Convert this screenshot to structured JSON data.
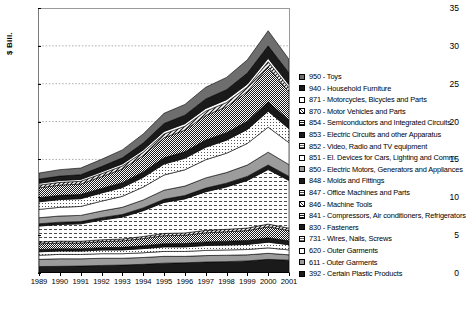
{
  "axis": {
    "ylabel": "$ Bill.",
    "yticks": [
      "0",
      "5",
      "10",
      "15",
      "20",
      "25",
      "30",
      "35"
    ],
    "ylim": [
      0,
      35
    ],
    "xticks": [
      "1989",
      "1990",
      "1991",
      "1992",
      "1993",
      "1994",
      "1995",
      "1996",
      "1997",
      "1998",
      "1999",
      "2000",
      "2001"
    ]
  },
  "legend": {
    "items": [
      {
        "label": "950 - Toys",
        "code": "950",
        "pattern": "dark-gray-solid"
      },
      {
        "label": "940 - Household Furniture",
        "code": "940",
        "pattern": "black-solid"
      },
      {
        "label": "871 - Motorcycles, Bicycles and Parts",
        "code": "871",
        "pattern": "white-solid"
      },
      {
        "label": "870 - Motor Vehicles and Parts",
        "code": "870",
        "pattern": "diagonal-hatch"
      },
      {
        "label": "854 - Semiconductors and Integrated Circuits",
        "code": "854",
        "pattern": "checker-dense"
      },
      {
        "label": "853 - Electric Circuits and other Apparatus",
        "code": "853",
        "pattern": "black-solid"
      },
      {
        "label": "852 - Video, Radio and TV equipment",
        "code": "852",
        "pattern": "light-dots"
      },
      {
        "label": "851 - El. Devices for Cars, Lighting and Comm.",
        "code": "851",
        "pattern": "white-solid"
      },
      {
        "label": "850 - Electric Motors, Generators and Appliances",
        "code": "850",
        "pattern": "mid-gray-solid"
      },
      {
        "label": "848 - Molds and Fittings",
        "code": "848",
        "pattern": "black-solid"
      },
      {
        "label": "847 - Office Machines and Parts",
        "code": "847",
        "pattern": "dash-grid"
      },
      {
        "label": "846 - Machine Tools",
        "code": "846",
        "pattern": "diagonal-hatch"
      },
      {
        "label": "841 - Compressors, Air conditioners, Refrigerators",
        "code": "841",
        "pattern": "checker-dense"
      },
      {
        "label": "830 - Fasteners",
        "code": "830",
        "pattern": "black-solid"
      },
      {
        "label": "731 - Wires, Nails, Screws",
        "code": "731",
        "pattern": "light-dots"
      },
      {
        "label": "620 - Outer Garments",
        "code": "620",
        "pattern": "white-solid"
      },
      {
        "label": "611 - Outer Garments",
        "code": "611",
        "pattern": "mid-gray-solid"
      },
      {
        "label": "392 - Certain Plastic Products",
        "code": "392",
        "pattern": "black-solid"
      }
    ]
  },
  "chart_data": {
    "type": "area",
    "title": "",
    "xlabel": "",
    "ylabel": "$ Bill.",
    "ylim": [
      0,
      35
    ],
    "grid": true,
    "legend_position": "right",
    "x": [
      "1989",
      "1990",
      "1991",
      "1992",
      "1993",
      "1994",
      "1995",
      "1996",
      "1997",
      "1998",
      "1999",
      "2000",
      "2001"
    ],
    "series": [
      {
        "name": "392 - Certain Plastic Products",
        "pattern": "black-solid",
        "values": [
          0.85,
          0.88,
          0.92,
          1.0,
          1.05,
          1.15,
          1.3,
          1.35,
          1.45,
          1.5,
          1.6,
          1.8,
          1.7
        ]
      },
      {
        "name": "611 - Outer Garments",
        "pattern": "mid-gray-solid",
        "values": [
          0.95,
          1.0,
          0.95,
          0.95,
          0.9,
          0.9,
          0.9,
          0.85,
          0.85,
          0.85,
          0.8,
          0.8,
          0.7
        ]
      },
      {
        "name": "620 - Outer Garments",
        "pattern": "white-solid",
        "values": [
          0.55,
          0.58,
          0.58,
          0.6,
          0.6,
          0.62,
          0.65,
          0.65,
          0.68,
          0.7,
          0.7,
          0.72,
          0.65
        ]
      },
      {
        "name": "731 - Wires, Nails, Screws",
        "pattern": "light-dots",
        "values": [
          0.45,
          0.45,
          0.45,
          0.48,
          0.5,
          0.55,
          0.6,
          0.6,
          0.65,
          0.65,
          0.68,
          0.75,
          0.68
        ]
      },
      {
        "name": "830 - Fasteners",
        "pattern": "black-solid",
        "values": [
          0.3,
          0.3,
          0.3,
          0.32,
          0.34,
          0.38,
          0.42,
          0.44,
          0.48,
          0.5,
          0.52,
          0.58,
          0.52
        ]
      },
      {
        "name": "841 - Compressors, Air conditioners, Refrigerators",
        "pattern": "checker-dense",
        "values": [
          0.75,
          0.75,
          0.75,
          0.8,
          0.85,
          0.95,
          1.05,
          1.1,
          1.2,
          1.25,
          1.3,
          1.45,
          1.35
        ]
      },
      {
        "name": "846 - Machine Tools",
        "pattern": "diagonal-hatch",
        "values": [
          0.25,
          0.25,
          0.24,
          0.24,
          0.25,
          0.27,
          0.3,
          0.3,
          0.32,
          0.32,
          0.33,
          0.36,
          0.32
        ]
      },
      {
        "name": "847 - Office Machines and Parts",
        "pattern": "dash-grid",
        "values": [
          2.1,
          2.2,
          2.3,
          2.6,
          2.9,
          3.4,
          4.1,
          4.5,
          5.1,
          5.6,
          6.3,
          7.2,
          6.3
        ]
      },
      {
        "name": "848 - Molds and Fittings",
        "pattern": "black-solid",
        "values": [
          0.3,
          0.3,
          0.3,
          0.32,
          0.34,
          0.38,
          0.42,
          0.44,
          0.48,
          0.5,
          0.53,
          0.6,
          0.54
        ]
      },
      {
        "name": "850 - Electric Motors, Generators and Appliances",
        "pattern": "mid-gray-solid",
        "values": [
          0.8,
          0.82,
          0.82,
          0.88,
          0.95,
          1.05,
          1.2,
          1.25,
          1.35,
          1.4,
          1.5,
          1.7,
          1.55
        ]
      },
      {
        "name": "851 - El. Devices for Cars, Lighting and Comm.",
        "pattern": "white-solid",
        "values": [
          1.1,
          1.15,
          1.18,
          1.3,
          1.45,
          1.7,
          2.0,
          2.15,
          2.4,
          2.55,
          2.85,
          3.3,
          2.9
        ]
      },
      {
        "name": "852 - Video, Radio and TV equipment",
        "pattern": "light-dots",
        "values": [
          1.0,
          1.02,
          1.02,
          1.08,
          1.15,
          1.28,
          1.45,
          1.52,
          1.65,
          1.72,
          1.85,
          2.1,
          1.85
        ]
      },
      {
        "name": "853 - Electric Circuits and other Apparatus",
        "pattern": "black-solid",
        "values": [
          0.55,
          0.56,
          0.56,
          0.6,
          0.65,
          0.72,
          0.82,
          0.86,
          0.95,
          1.0,
          1.08,
          1.25,
          1.1
        ]
      },
      {
        "name": "854 - Semiconductors and Integrated Circuits",
        "pattern": "checker-dense",
        "values": [
          1.3,
          1.35,
          1.38,
          1.55,
          1.8,
          2.15,
          2.65,
          2.85,
          3.25,
          3.4,
          3.9,
          4.6,
          3.7
        ]
      },
      {
        "name": "870 - Motor Vehicles and Parts",
        "pattern": "diagonal-hatch",
        "values": [
          0.35,
          0.36,
          0.36,
          0.38,
          0.4,
          0.44,
          0.5,
          0.52,
          0.56,
          0.58,
          0.62,
          0.7,
          0.62
        ]
      },
      {
        "name": "871 - Motorcycles, Bicycles and Parts",
        "pattern": "white-solid",
        "values": [
          0.25,
          0.25,
          0.25,
          0.26,
          0.28,
          0.3,
          0.33,
          0.34,
          0.36,
          0.37,
          0.39,
          0.44,
          0.39
        ]
      },
      {
        "name": "940 - Household Furniture",
        "pattern": "black-solid",
        "values": [
          0.55,
          0.58,
          0.62,
          0.7,
          0.8,
          0.92,
          1.05,
          1.12,
          1.25,
          1.32,
          1.45,
          1.65,
          1.55
        ]
      },
      {
        "name": "950 - Toys",
        "pattern": "dark-gray-solid",
        "values": [
          0.8,
          0.85,
          0.88,
          0.95,
          1.05,
          1.2,
          1.35,
          1.42,
          1.55,
          1.62,
          1.75,
          2.0,
          1.8
        ]
      }
    ],
    "totals": [
      13.2,
      13.65,
      13.86,
      15.01,
      16.26,
      18.36,
      21.09,
      22.26,
      24.53,
      25.83,
      28.15,
      32.0,
      27.82
    ]
  }
}
